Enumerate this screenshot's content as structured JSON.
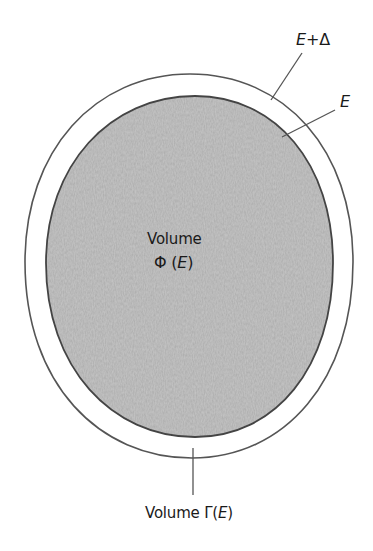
{
  "figure": {
    "type": "phase-space-volume-diagram",
    "outer_boundary": {
      "label": "E+Δ",
      "label_parts": {
        "var": "E",
        "op": "+",
        "delta": "Δ"
      },
      "stroke_color": "#555555"
    },
    "inner_boundary": {
      "label": "E",
      "stroke_color": "#444444",
      "fill_color": "#c6c6c6"
    },
    "inner_region_label": {
      "title": "Volume",
      "symbol": "Φ",
      "argument": "E",
      "expression": "Φ (E)"
    },
    "shell_label": {
      "title": "Volume",
      "symbol": "Γ",
      "argument": "E",
      "expression": "Volume Γ(E)"
    },
    "colors": {
      "background": "#ffffff",
      "text": "#1a1a1a",
      "leader_line": "#555555"
    }
  }
}
